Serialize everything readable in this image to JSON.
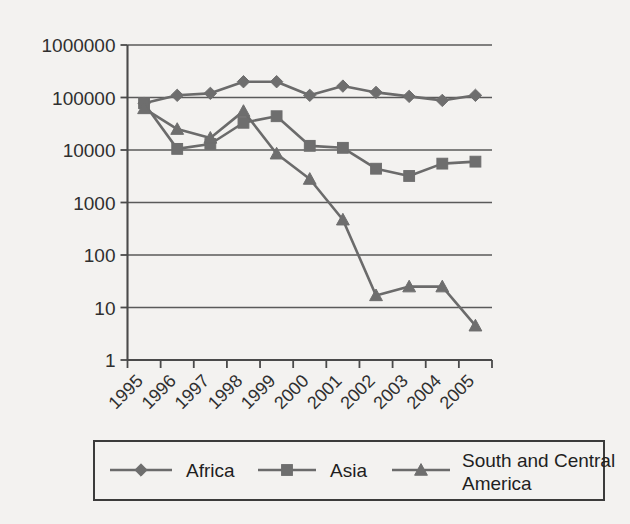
{
  "chart_data": {
    "type": "line",
    "title": "",
    "subtitle": "",
    "xlabel": "",
    "ylabel": "",
    "yscale": "log",
    "ylim": [
      1,
      1000000
    ],
    "grid": true,
    "legend_position": "bottom",
    "categories": [
      "1995",
      "1996",
      "1997",
      "1998",
      "1999",
      "2000",
      "2001",
      "2002",
      "2003",
      "2004",
      "2005"
    ],
    "y_ticks": [
      1,
      10,
      100,
      1000,
      10000,
      100000,
      1000000
    ],
    "y_tick_labels": [
      "1",
      "10",
      "100",
      "1000",
      "10000",
      "100000",
      "1000000"
    ],
    "series": [
      {
        "name": "Africa",
        "marker": "diamond",
        "color": "#6e6e6e",
        "values": [
          78000,
          110000,
          120000,
          200000,
          200000,
          110000,
          165000,
          125000,
          105000,
          88000,
          110000
        ]
      },
      {
        "name": "Asia",
        "marker": "square",
        "color": "#6e6e6e",
        "values": [
          78000,
          10500,
          13000,
          33000,
          44000,
          12000,
          11000,
          4400,
          3200,
          5500,
          6000
        ]
      },
      {
        "name": "South and Central America",
        "marker": "triangle",
        "color": "#6e6e6e",
        "values": [
          62000,
          25000,
          17000,
          55000,
          8500,
          2800,
          470,
          17,
          25,
          25,
          4.5
        ]
      }
    ]
  },
  "legend": {
    "entries": [
      {
        "label": "Africa",
        "marker": "diamond-icon"
      },
      {
        "label": "Asia",
        "marker": "square-icon"
      },
      {
        "label": "South and Central",
        "label2": "America",
        "marker": "triangle-icon"
      }
    ]
  },
  "axes": {
    "y_labels": [
      "1000000",
      "100000",
      "10000",
      "1000",
      "100",
      "10",
      "1"
    ],
    "x_labels": [
      "1995",
      "1996",
      "1997",
      "1998",
      "1999",
      "2000",
      "2001",
      "2002",
      "2003",
      "2004",
      "2005"
    ]
  }
}
